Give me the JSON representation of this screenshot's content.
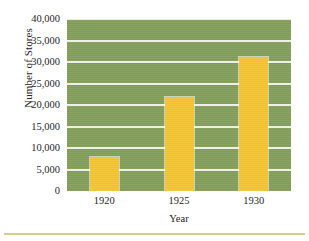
{
  "chart_data": {
    "type": "bar",
    "title": "",
    "xlabel": "Year",
    "ylabel": "Number of Stores",
    "categories": [
      "1920",
      "1925",
      "1930"
    ],
    "values": [
      8000,
      21800,
      31200
    ],
    "series": [
      {
        "name": "Number of Stores",
        "values": [
          8000,
          21800,
          31200
        ]
      }
    ],
    "ylim": [
      0,
      40000
    ],
    "ytick_values": [
      0,
      5000,
      10000,
      15000,
      20000,
      25000,
      30000,
      35000,
      40000
    ],
    "ytick_labels": [
      "0",
      "5,000",
      "10,000",
      "15,000",
      "20,000",
      "25,000",
      "30,000",
      "35,000",
      "40,000"
    ],
    "xtick_labels": [
      "1920",
      "1925",
      "1930"
    ],
    "grid": true,
    "grid_orientation": "horizontal",
    "legend": false,
    "legend_position": "none",
    "colors": {
      "plot_background": "#85a05d",
      "bar_fill": "#f4c433",
      "gridline": "#f4f5ee",
      "text": "#262626",
      "page_background": "#ffffff",
      "bottom_rule": "#c9c96b"
    }
  }
}
